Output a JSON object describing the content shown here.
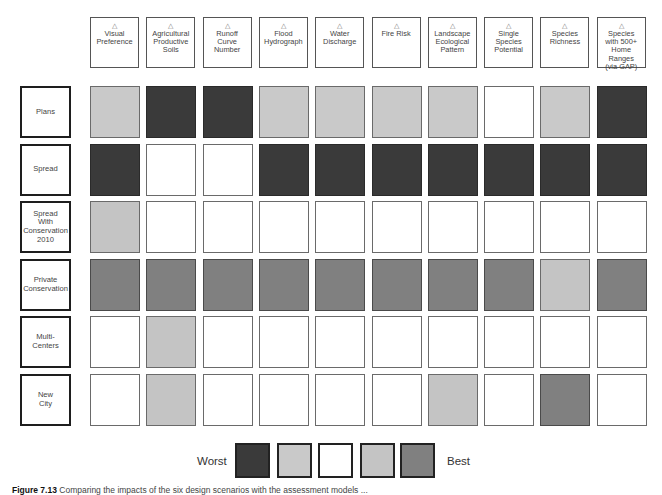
{
  "chart_data": {
    "type": "heatmap",
    "title": "",
    "columns": [
      "Visual Preference",
      "Agricultural Productive Soils",
      "Runoff Curve Number",
      "Flood Hydrograph",
      "Water Discharge",
      "Fire Risk",
      "Landscape Ecological Pattern",
      "Single Species Potential",
      "Species Richness",
      "Species with 500+ Home Ranges (via GAP)"
    ],
    "rows": [
      "Plans",
      "Spread",
      "Spread With Conservation 2010",
      "Private Conservation",
      "Multi-Centers",
      "New City"
    ],
    "scale": [
      "Worst",
      "Worse",
      "Neutral",
      "Better",
      "Best"
    ],
    "scale_colors": [
      "#3a3a3a",
      "#c9c9c9",
      "#ffffff",
      "#c4c4c4",
      "#808080"
    ],
    "values": [
      [
        2,
        1,
        1,
        2,
        2,
        2,
        2,
        3,
        2,
        1
      ],
      [
        1,
        3,
        3,
        1,
        1,
        1,
        1,
        1,
        1,
        1
      ],
      [
        4,
        3,
        3,
        3,
        3,
        3,
        3,
        3,
        3,
        3
      ],
      [
        5,
        5,
        5,
        5,
        5,
        5,
        5,
        5,
        4,
        5
      ],
      [
        3,
        4,
        3,
        3,
        3,
        3,
        3,
        3,
        3,
        3
      ],
      [
        3,
        4,
        3,
        3,
        3,
        3,
        4,
        3,
        5,
        3
      ]
    ],
    "legend": {
      "left_label": "Worst",
      "right_label": "Best"
    }
  },
  "headers": [
    {
      "lines": [
        "Visual",
        "Preference"
      ]
    },
    {
      "lines": [
        "Agricultural",
        "Productive",
        "Soils"
      ]
    },
    {
      "lines": [
        "Runoff",
        "Curve",
        "Number"
      ]
    },
    {
      "lines": [
        "Flood",
        "Hydrograph"
      ]
    },
    {
      "lines": [
        "Water",
        "Discharge"
      ]
    },
    {
      "lines": [
        "Fire Risk"
      ]
    },
    {
      "lines": [
        "Landscape",
        "Ecological",
        "Pattern"
      ]
    },
    {
      "lines": [
        "Single",
        "Species",
        "Potential"
      ]
    },
    {
      "lines": [
        "Species",
        "Richness"
      ]
    },
    {
      "lines": [
        "Species",
        "with 500+",
        "Home Ranges",
        "(via GAP)"
      ]
    }
  ],
  "header_icon": "△",
  "row_labels": [
    {
      "lines": [
        "Plans"
      ]
    },
    {
      "lines": [
        "Spread"
      ]
    },
    {
      "lines": [
        "Spread",
        "With",
        "Conservation",
        "2010"
      ]
    },
    {
      "lines": [
        "Private",
        "Conservation"
      ]
    },
    {
      "lines": [
        "Multi-",
        "Centers"
      ]
    },
    {
      "lines": [
        "New",
        "City"
      ]
    }
  ],
  "legend": {
    "worst": "Worst",
    "best": "Best"
  },
  "caption": {
    "label": "Figure 7.13",
    "text": "Comparing the impacts of the six design scenarios with the assessment models ..."
  }
}
